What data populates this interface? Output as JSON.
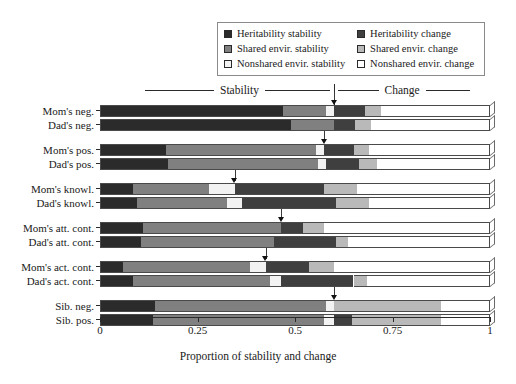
{
  "legend": {
    "items": [
      {
        "label": "Heritability stability",
        "color": "#2b2b2b",
        "swatch": "legend-swatch-heritability-stability"
      },
      {
        "label": "Heritability change",
        "color": "#3f3f3f",
        "swatch": "legend-swatch-heritability-change"
      },
      {
        "label": "Shared envir. stability",
        "color": "#808080",
        "swatch": "legend-swatch-shared-stability"
      },
      {
        "label": "Shared envir. change",
        "color": "#b9b9b9",
        "swatch": "legend-swatch-shared-change"
      },
      {
        "label": "Nonshared envir. stability",
        "color": "#f2f2f2",
        "swatch": "legend-swatch-nonshared-stability"
      },
      {
        "label": "Nonshared envir. change",
        "color": "#ffffff",
        "swatch": "legend-swatch-nonshared-change"
      }
    ]
  },
  "header": {
    "stability_label": "Stability",
    "change_label": "Change"
  },
  "axis": {
    "xlabel": "Proportion of stability and change",
    "ticks": [
      "0",
      "0.25",
      "0.5",
      "0.75",
      "1"
    ],
    "tick_values": [
      0,
      0.25,
      0.5,
      0.75,
      1
    ]
  },
  "chart_data": {
    "type": "bar",
    "orientation": "horizontal",
    "stacked": true,
    "title": "",
    "xlabel": "Proportion of stability and change",
    "ylabel": "",
    "xlim": [
      0,
      1
    ],
    "grid": false,
    "legend_position": "top",
    "annotations": [
      "Stability",
      "Change"
    ],
    "categories": [
      "Mom's neg.",
      "Dad's neg.",
      "Mom's pos.",
      "Dad's pos.",
      "Mom's knowl.",
      "Dad's knowl.",
      "Mom's att. cont.",
      "Dad's att. cont.",
      "Mom's act. cont.",
      "Dad's act. cont.",
      "Sib. neg.",
      "Sib. pos."
    ],
    "series": [
      {
        "name": "Heritability stability",
        "color": "#2b2b2b",
        "values": [
          0.47,
          0.49,
          0.17,
          0.175,
          0.085,
          0.095,
          0.11,
          0.105,
          0.06,
          0.085,
          0.14,
          0.135
        ]
      },
      {
        "name": "Shared envir. stability",
        "color": "#808080",
        "values": [
          0.11,
          0.11,
          0.385,
          0.385,
          0.195,
          0.23,
          0.355,
          0.34,
          0.325,
          0.35,
          0.44,
          0.44
        ]
      },
      {
        "name": "Nonshared envir. stability",
        "color": "#f2f2f2",
        "values": [
          0.02,
          0.0,
          0.02,
          0.02,
          0.065,
          0.04,
          0.0,
          0.0,
          0.04,
          0.03,
          0.02,
          0.025
        ]
      },
      {
        "name": "Heritability change",
        "color": "#3f3f3f",
        "values": [
          0.08,
          0.055,
          0.075,
          0.085,
          0.23,
          0.24,
          0.055,
          0.16,
          0.11,
          0.185,
          0.0,
          0.045
        ]
      },
      {
        "name": "Shared envir. change",
        "color": "#b9b9b9",
        "values": [
          0.04,
          0.04,
          0.04,
          0.045,
          0.085,
          0.085,
          0.055,
          0.03,
          0.065,
          0.035,
          0.275,
          0.23
        ]
      },
      {
        "name": "Nonshared envir. change",
        "color": "#ffffff",
        "values": [
          0.28,
          0.305,
          0.31,
          0.29,
          0.34,
          0.31,
          0.425,
          0.365,
          0.4,
          0.315,
          0.125,
          0.125
        ]
      }
    ],
    "stability_change_boundaries": [
      0.6,
      0.6,
      0.575,
      0.58,
      0.345,
      0.365,
      0.465,
      0.445,
      0.425,
      0.465,
      0.6,
      0.6
    ],
    "boundary_markers": [
      0.6,
      0.6,
      0.575,
      0.58,
      0.345,
      0.365,
      0.465,
      0.445,
      0.425,
      0.465,
      0.6,
      0.6
    ],
    "main_divider": 0.6
  }
}
